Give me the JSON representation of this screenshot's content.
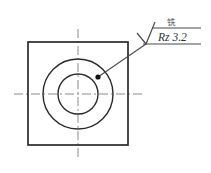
{
  "drawing": {
    "title": "Surface roughness annotation on square plate with concentric bore",
    "background_color": "#ffffff",
    "line_color": "#2b2b2b",
    "centerline_color": "#8a8a8a",
    "annotation_color": "#4a4a4a"
  },
  "annotation": {
    "roughness_label": "Rz 3.2",
    "process_label": "铣",
    "symbol_name": "surface-roughness-symbol"
  },
  "geometry": {
    "plate": {
      "x": 28,
      "y": 42,
      "width": 100,
      "height": 103
    },
    "outer_circle": {
      "cx": 78,
      "cy": 94,
      "r": 35
    },
    "inner_circle": {
      "cx": 78,
      "cy": 94,
      "r": 20
    },
    "reference_dot": {
      "cx": 98,
      "cy": 77,
      "r": 2.6
    },
    "horizontal_centerline": {
      "x1": 14,
      "y1": 94,
      "x2": 143,
      "y2": 94
    },
    "vertical_centerline": {
      "x1": 78,
      "y1": 29,
      "x2": 78,
      "y2": 159
    },
    "leader": {
      "x1": 98,
      "y1": 77,
      "x2": 146,
      "y2": 44
    },
    "upper_reference_line": {
      "x1": 152,
      "y1": 28,
      "x2": 201,
      "y2": 28
    },
    "lower_reference_line": {
      "x1": 143,
      "y1": 44,
      "x2": 201,
      "y2": 44
    }
  }
}
